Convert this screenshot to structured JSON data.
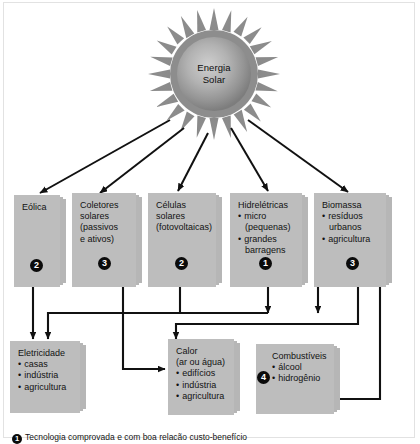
{
  "figure": {
    "source_node": {
      "line1": "Energia",
      "line2": "Solar"
    }
  },
  "sources": [
    {
      "id": "eolica",
      "title": "Eólica",
      "items": [],
      "badge": "2"
    },
    {
      "id": "coletores-solares",
      "title": "Coletores",
      "lines": [
        "solares",
        "(passivos",
        "e ativos)"
      ],
      "badge": "3"
    },
    {
      "id": "celulas-solares",
      "title": "Células",
      "lines": [
        "solares",
        "(fotovoltaicas)"
      ],
      "badge": "2"
    },
    {
      "id": "hidreletricas",
      "title": "Hidrelétricas",
      "items": [
        "micro",
        "(pequenas)",
        "grandes",
        "barragens"
      ],
      "badge": "1"
    },
    {
      "id": "biomassa",
      "title": "Biomassa",
      "items": [
        "resíduos",
        "urbanos",
        "agricultura"
      ],
      "badge": "3"
    }
  ],
  "outputs": [
    {
      "id": "eletricidade",
      "title": "Eletricidade",
      "items": [
        "casas",
        "indústria",
        "agricultura"
      ]
    },
    {
      "id": "calor",
      "title": "Calor",
      "subtitle": "(ar ou água)",
      "items": [
        "edifícios",
        "indústria",
        "agricultura"
      ]
    },
    {
      "id": "combustiveis",
      "title": "Combustíveis",
      "items": [
        "álcool",
        "hidrogênio"
      ],
      "badge": "4"
    }
  ],
  "legend": {
    "number": "1",
    "text": "Tecnologia comprovada e com boa relacão custo-benefício"
  },
  "colors": {
    "box_fill": "#b6b6b6",
    "box_fill_front": "#bdbdbd",
    "line": "#111111",
    "badge_fill": "#0b0b0b",
    "frame": "#e2e2e2",
    "sun_outer": "#8a8a8a",
    "sun_inner": "#c9c9c9"
  }
}
